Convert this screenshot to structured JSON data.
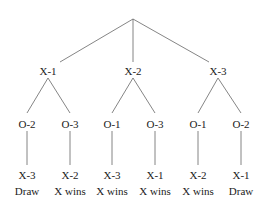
{
  "diagram": {
    "type": "game-tree",
    "root": "",
    "level1": [
      {
        "label": "X-1",
        "x": 48
      },
      {
        "label": "X-2",
        "x": 133
      },
      {
        "label": "X-3",
        "x": 218
      }
    ],
    "level2": [
      {
        "label": "O-2",
        "x": 27,
        "parent": 0
      },
      {
        "label": "O-3",
        "x": 70,
        "parent": 0
      },
      {
        "label": "O-1",
        "x": 112,
        "parent": 1
      },
      {
        "label": "O-3",
        "x": 155,
        "parent": 1
      },
      {
        "label": "O-1",
        "x": 198,
        "parent": 2
      },
      {
        "label": "O-2",
        "x": 241,
        "parent": 2
      }
    ],
    "level3": [
      {
        "label": "X-3",
        "outcome": "Draw"
      },
      {
        "label": "X-2",
        "outcome": "X wins"
      },
      {
        "label": "X-3",
        "outcome": "X wins"
      },
      {
        "label": "X-1",
        "outcome": "X wins"
      },
      {
        "label": "X-2",
        "outcome": "X wins"
      },
      {
        "label": "X-1",
        "outcome": "Draw"
      }
    ],
    "colors": {
      "line": "#666666",
      "text": "#222222",
      "background": "#ffffff"
    }
  }
}
